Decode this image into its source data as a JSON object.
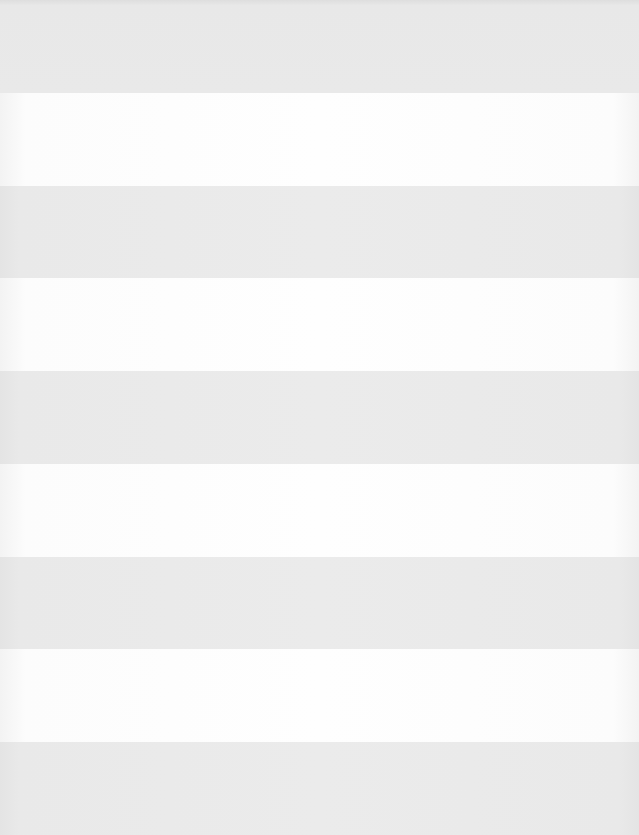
{
  "pattern": {
    "description": "horizontal stripes",
    "band_count": 9,
    "colors": {
      "gray": "#e9e9e9",
      "white": "#fdfdfd"
    },
    "bands": [
      {
        "index": 0,
        "tone": "gray"
      },
      {
        "index": 1,
        "tone": "white"
      },
      {
        "index": 2,
        "tone": "gray"
      },
      {
        "index": 3,
        "tone": "white"
      },
      {
        "index": 4,
        "tone": "gray"
      },
      {
        "index": 5,
        "tone": "white"
      },
      {
        "index": 6,
        "tone": "gray"
      },
      {
        "index": 7,
        "tone": "white"
      },
      {
        "index": 8,
        "tone": "gray"
      }
    ]
  }
}
